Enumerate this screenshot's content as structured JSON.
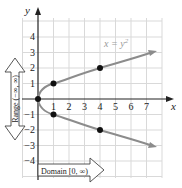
{
  "figure": {
    "equation_label": "x = y²",
    "equation_lhs": "x = y",
    "equation_exp": "2",
    "x_axis_label": "x",
    "y_axis_label": "y",
    "x_ticks": [
      "1",
      "2",
      "3",
      "4",
      "5",
      "6",
      "7"
    ],
    "y_ticks_pos": [
      "1",
      "2",
      "3",
      "4"
    ],
    "y_ticks_neg": [
      "−1",
      "−2",
      "−3",
      "−4"
    ],
    "domain_label": "Domain [0, ∞)",
    "range_label": "Range (−∞, ∞)",
    "points": [
      {
        "x": 0,
        "y": 0
      },
      {
        "x": 1,
        "y": 1
      },
      {
        "x": 1,
        "y": -1
      },
      {
        "x": 4,
        "y": 2
      },
      {
        "x": 4,
        "y": -2
      }
    ],
    "colors": {
      "grid": "#d9d9d9",
      "axis": "#222222",
      "curve": "#8c8c8c",
      "point": "#111111",
      "label_text": "#999999"
    }
  }
}
